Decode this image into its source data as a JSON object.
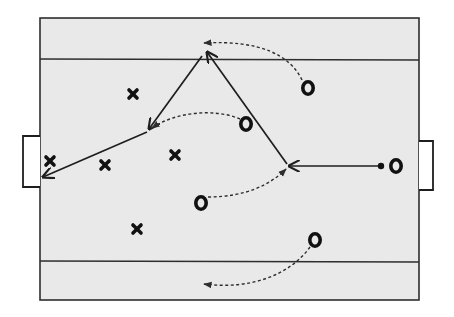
{
  "diagram": {
    "type": "football-training-drill",
    "colors": {
      "background": "#ffffff",
      "pitch_fill": "#e9e9e9",
      "line": "#2e2e2e",
      "marker": "#111111"
    },
    "pitch": {
      "x": 40,
      "y": 18,
      "width": 379,
      "height": 282
    },
    "channel_lines": [
      {
        "name": "top-channel-line",
        "y": 59
      },
      {
        "name": "bottom-channel-line",
        "y": 262
      }
    ],
    "goals": [
      {
        "name": "left-goal",
        "x": 22,
        "y": 136,
        "width": 18,
        "height": 51
      },
      {
        "name": "right-goal",
        "x": 419,
        "y": 141,
        "width": 15,
        "height": 49
      }
    ],
    "defenders": [
      {
        "id": "x1",
        "x": 133,
        "y": 94
      },
      {
        "id": "x2",
        "x": 50,
        "y": 161
      },
      {
        "id": "x3",
        "x": 105,
        "y": 165
      },
      {
        "id": "x4",
        "x": 175,
        "y": 155
      },
      {
        "id": "x5",
        "x": 137,
        "y": 229
      }
    ],
    "attackers": [
      {
        "id": "o1",
        "x": 308,
        "y": 88
      },
      {
        "id": "o2",
        "x": 246,
        "y": 124
      },
      {
        "id": "o3",
        "x": 201,
        "y": 203
      },
      {
        "id": "o4",
        "x": 396,
        "y": 166
      },
      {
        "id": "o5",
        "x": 315,
        "y": 240
      }
    ],
    "ball": {
      "x": 381,
      "y": 166
    },
    "passes": [
      {
        "name": "pass-1",
        "from": [
          378,
          166
        ],
        "to": [
          289,
          166
        ]
      },
      {
        "name": "pass-2",
        "from": [
          287,
          164
        ],
        "to": [
          207,
          52
        ]
      },
      {
        "name": "pass-3",
        "from": [
          202,
          56
        ],
        "to": [
          149,
          129
        ]
      },
      {
        "name": "pass-4",
        "from": [
          147,
          132
        ],
        "to": [
          43,
          177
        ]
      }
    ],
    "runs": [
      {
        "name": "run-o1",
        "path": "M302,80 C290,55 260,40 202,43"
      },
      {
        "name": "run-o2",
        "path": "M240,119 C215,108 175,112 151,128"
      },
      {
        "name": "run-o3",
        "path": "M208,197 C245,197 270,185 287,168"
      },
      {
        "name": "run-o5",
        "path": "M310,247 C290,275 250,290 202,284"
      }
    ]
  }
}
